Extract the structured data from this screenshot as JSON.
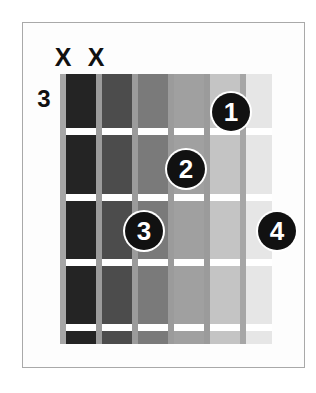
{
  "diagram": {
    "type": "guitar-chord-diagram",
    "starting_fret_label": "3",
    "string_count": 6,
    "fret_space_count": 5,
    "fret_line_count": 4,
    "mute_markers": [
      {
        "label": "X",
        "string": 1,
        "left": 52,
        "top": 45
      },
      {
        "label": "X",
        "string": 2,
        "left": 85,
        "top": 45
      }
    ],
    "finger_dots": [
      {
        "label": "1",
        "string": 5,
        "fret": 1,
        "left": 212,
        "top": 93
      },
      {
        "label": "2",
        "string": 4,
        "fret": 2,
        "left": 167,
        "top": 150
      },
      {
        "label": "3",
        "string": 3,
        "fret": 3,
        "left": 125,
        "top": 212
      },
      {
        "label": "4",
        "string": 6,
        "fret": 3,
        "left": 258,
        "top": 212
      }
    ],
    "string_columns": [
      {
        "index": 1,
        "left": 0,
        "width": 36,
        "shade": "#242424"
      },
      {
        "index": 2,
        "left": 36,
        "width": 36,
        "shade": "#4c4c4c"
      },
      {
        "index": 3,
        "left": 72,
        "width": 36,
        "shade": "#7a7a7a"
      },
      {
        "index": 4,
        "left": 108,
        "width": 36,
        "shade": "#a0a0a0"
      },
      {
        "index": 5,
        "left": 144,
        "width": 36,
        "shade": "#c4c4c4"
      },
      {
        "index": 6,
        "left": 180,
        "width": 32,
        "shade": "#e6e6e6"
      }
    ],
    "string_lines": [
      {
        "index": 1,
        "left": 0,
        "outer": true
      },
      {
        "index": 2,
        "left": 36,
        "outer": false
      },
      {
        "index": 3,
        "left": 72,
        "outer": false
      },
      {
        "index": 4,
        "left": 108,
        "outer": false
      },
      {
        "index": 5,
        "left": 144,
        "outer": false
      },
      {
        "index": 6,
        "left": 180,
        "outer": true
      }
    ],
    "fret_lines": [
      {
        "index": 1,
        "top": 54
      },
      {
        "index": 2,
        "top": 120
      },
      {
        "index": 3,
        "top": 185
      },
      {
        "index": 4,
        "top": 250
      }
    ],
    "colors": {
      "frame": "#a9a9a9",
      "dot_fill": "#111111",
      "dot_text": "#ffffff",
      "fret_line": "#ffffff",
      "string_line": "#9b9b9b",
      "background": "#ffffff"
    }
  }
}
